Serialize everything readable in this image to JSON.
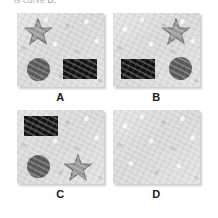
{
  "caption": {
    "prefix": "is curve ",
    "bold": "D."
  },
  "diagram": {
    "type": "multiple-choice-option-grid",
    "panel_color": "#dedede",
    "colors": {
      "star_fill": "#9a9a9a",
      "star_stroke": "#6e6e6e",
      "circle_fill": "#585858",
      "rect_fill": "#121212",
      "panel_background": "#dedede",
      "label_color": "#1b1b1b",
      "page_background": "#ffffff"
    },
    "options": [
      {
        "label": "A",
        "row": 0,
        "column": 0,
        "empty": false,
        "shapes": [
          {
            "shape": "star",
            "fill": "#9a9a9a",
            "position": "top-left"
          },
          {
            "shape": "circle",
            "fill": "#585858",
            "position": "bottom-left"
          },
          {
            "shape": "rectangle",
            "fill": "#121212",
            "position": "bottom-right"
          }
        ]
      },
      {
        "label": "B",
        "row": 0,
        "column": 1,
        "empty": false,
        "shapes": [
          {
            "shape": "star",
            "fill": "#9a9a9a",
            "position": "top-right"
          },
          {
            "shape": "rectangle",
            "fill": "#121212",
            "position": "bottom-left"
          },
          {
            "shape": "circle",
            "fill": "#585858",
            "position": "bottom-right"
          }
        ]
      },
      {
        "label": "C",
        "row": 1,
        "column": 0,
        "empty": false,
        "shapes": [
          {
            "shape": "rectangle",
            "fill": "#121212",
            "position": "top-left"
          },
          {
            "shape": "circle",
            "fill": "#585858",
            "position": "bottom-left"
          },
          {
            "shape": "star",
            "fill": "#9a9a9a",
            "position": "bottom-right"
          }
        ]
      },
      {
        "label": "D",
        "row": 1,
        "column": 1,
        "empty": true,
        "shapes": []
      }
    ]
  }
}
